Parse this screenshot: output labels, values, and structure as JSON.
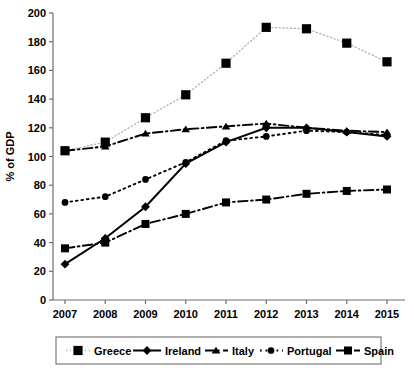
{
  "chart_data": {
    "type": "line",
    "title": "",
    "xlabel": "",
    "ylabel": "% of GDP",
    "x": [
      "2007",
      "2008",
      "2009",
      "2010",
      "2011",
      "2012",
      "2013",
      "2014",
      "2015"
    ],
    "xlim": [
      2007,
      2015
    ],
    "ylim": [
      0,
      200
    ],
    "yticks": [
      "0",
      "20",
      "40",
      "60",
      "80",
      "100",
      "120",
      "140",
      "160",
      "180",
      "200"
    ],
    "ytick_step": 20,
    "grid": false,
    "legend_position": "bottom",
    "series": [
      {
        "name": "Greece",
        "marker": "square",
        "line_style": "dotted",
        "color": "#000000",
        "line_color": "#b0b0b0",
        "values": [
          104,
          110,
          127,
          143,
          165,
          190,
          189,
          179,
          166
        ]
      },
      {
        "name": "Ireland",
        "marker": "diamond",
        "line_style": "solid",
        "color": "#000000",
        "line_color": "#000000",
        "values": [
          25,
          43,
          65,
          95,
          110,
          120,
          120,
          117,
          114
        ]
      },
      {
        "name": "Italy",
        "marker": "triangle",
        "line_style": "dash-dot",
        "color": "#000000",
        "line_color": "#000000",
        "values": [
          104,
          107,
          116,
          119,
          121,
          123,
          120,
          118,
          117
        ]
      },
      {
        "name": "Portugal",
        "marker": "circle",
        "line_style": "dotted",
        "color": "#000000",
        "line_color": "#000000",
        "values": [
          68,
          72,
          84,
          96,
          111,
          114,
          118,
          117,
          115
        ]
      },
      {
        "name": "Spain",
        "marker": "square",
        "line_style": "dash-dot",
        "color": "#000000",
        "line_color": "#000000",
        "values": [
          36,
          40,
          53,
          60,
          68,
          70,
          74,
          76,
          77
        ]
      }
    ]
  },
  "axes": {
    "y_axis_label": "% of GDP"
  },
  "legend": {
    "items": [
      "Greece",
      "Ireland",
      "Italy",
      "Portugal",
      "Spain"
    ]
  }
}
